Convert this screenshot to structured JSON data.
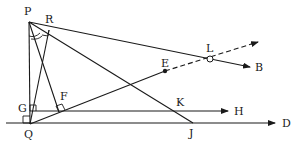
{
  "diagram": {
    "type": "geometry",
    "colors": {
      "ink": "#1a1a1a",
      "background": "#ffffff"
    },
    "points": {
      "P": {
        "label": "P",
        "x": 29,
        "y": 22
      },
      "R": {
        "label": "R",
        "x": 49,
        "y": 30
      },
      "Q": {
        "label": "Q",
        "x": 30,
        "y": 124
      },
      "G": {
        "label": "G",
        "x": 33,
        "y": 111
      },
      "F": {
        "label": "F",
        "x": 59,
        "y": 112
      },
      "E": {
        "label": "E",
        "x": 165,
        "y": 71
      },
      "L": {
        "label": "L",
        "x": 210,
        "y": 59
      },
      "K": {
        "label": "K",
        "x": 178,
        "y": 104
      },
      "J": {
        "label": "J",
        "x": 193,
        "y": 123
      },
      "B": {
        "label": "B"
      },
      "H": {
        "label": "H"
      },
      "D": {
        "label": "D"
      }
    },
    "segments": [
      {
        "from": "P",
        "to": "Q",
        "style": "solid"
      },
      {
        "from": "P",
        "to": "F",
        "style": "solid"
      },
      {
        "from": "R",
        "to": "Q",
        "style": "solid"
      },
      {
        "from": "P",
        "to": "J",
        "style": "solid"
      },
      {
        "from": "R",
        "to": "L",
        "style": "solid"
      },
      {
        "from": "Q",
        "to": "E",
        "style": "solid"
      }
    ],
    "rays": [
      {
        "from": "P",
        "through": "L",
        "to": "B",
        "style": "solid",
        "arrow": true
      },
      {
        "from": "E",
        "through": "L",
        "style": "dashed",
        "arrow": true
      },
      {
        "from": "G",
        "through": "K",
        "to": "H",
        "style": "solid",
        "arrow": true
      },
      {
        "from": "Q",
        "through": "J",
        "to": "D",
        "style": "solid",
        "arrow": true
      }
    ],
    "right_angles": [
      "R",
      "F",
      "G",
      "Q"
    ],
    "angle_marks": [
      "P"
    ],
    "marked_points": {
      "E": "filled-dot",
      "L": "open-circle"
    }
  }
}
